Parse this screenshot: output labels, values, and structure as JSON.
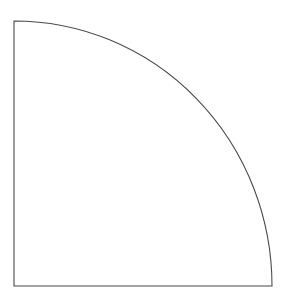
{
  "figure": {
    "title": "Quarter circle sector outline",
    "background_color": "#ffffff",
    "stroke_color": "#4a4a4a",
    "stroke_width": 1.1,
    "fill_color": "none",
    "canvas": {
      "width": 285,
      "height": 297
    },
    "geometry": {
      "shape_type": "quarter-ellipse-sector",
      "corner_top_left": {
        "x": 14,
        "y": 21
      },
      "corner_bottom_left": {
        "x": 14,
        "y": 286
      },
      "corner_bottom_right": {
        "x": 272,
        "y": 286
      },
      "arc_start": {
        "x": 14,
        "y": 21
      },
      "arc_end": {
        "x": 272,
        "y": 286
      },
      "arc_center": {
        "x": 14,
        "y": 286
      },
      "radius_x": 258,
      "radius_y": 265,
      "arc_sweep_degrees": 90,
      "arc_direction": "clockwise",
      "arc_convexity": "convex-outward"
    },
    "edges": [
      {
        "name": "left-edge",
        "type": "straight",
        "from": {
          "x": 14,
          "y": 21
        },
        "to": {
          "x": 14,
          "y": 286
        },
        "length": 265,
        "orientation": "vertical"
      },
      {
        "name": "bottom-edge",
        "type": "straight",
        "from": {
          "x": 14,
          "y": 286
        },
        "to": {
          "x": 272,
          "y": 286
        },
        "length": 258,
        "orientation": "horizontal"
      },
      {
        "name": "arc-edge",
        "type": "arc",
        "from": {
          "x": 14,
          "y": 21
        },
        "to": {
          "x": 272,
          "y": 286
        },
        "orientation": "curved"
      }
    ],
    "path_d": "M 14 21 A 258 265 0 0 1 272 286 L 14 286 Z",
    "arc_sample_points": [
      {
        "x": 14,
        "y": 21
      },
      {
        "x": 54,
        "y": 24
      },
      {
        "x": 94,
        "y": 31
      },
      {
        "x": 140,
        "y": 57
      },
      {
        "x": 164,
        "y": 77
      },
      {
        "x": 186,
        "y": 99
      },
      {
        "x": 198,
        "y": 112
      },
      {
        "x": 207,
        "y": 130
      },
      {
        "x": 215,
        "y": 150
      },
      {
        "x": 232,
        "y": 180
      },
      {
        "x": 245,
        "y": 200
      },
      {
        "x": 258,
        "y": 233
      },
      {
        "x": 266,
        "y": 258
      },
      {
        "x": 272,
        "y": 286
      }
    ],
    "labels": [],
    "annotations": [],
    "text_content": []
  }
}
